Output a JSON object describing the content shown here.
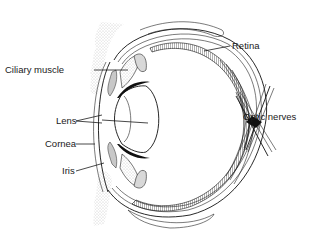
{
  "diagram": {
    "labels": {
      "ciliary_muscle": "Ciliary muscle",
      "lens": "Lens",
      "cornea": "Cornea",
      "iris": "Iris",
      "retina": "Retina",
      "optic_nerves": "Optic nerves"
    },
    "colors": {
      "ink": "#1a1a1a",
      "background": "#ffffff",
      "stipple": "#9a9a9a"
    }
  }
}
